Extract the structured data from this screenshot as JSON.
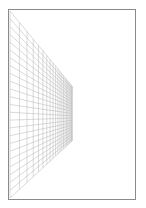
{
  "canvas": {
    "width": 146,
    "height": 208,
    "background": "#ffffff"
  },
  "page": {
    "border_color": "#8a8a8a"
  },
  "perspective_grid": {
    "line_color": "#b4b4b4",
    "near_edge": {
      "x": 10,
      "y_top": 11,
      "y_bottom": 198
    },
    "far_edge": {
      "x": 72,
      "y_top": 86,
      "y_bottom": 141
    },
    "vertical_divisions": 20,
    "horizontal_divisions": 24
  }
}
